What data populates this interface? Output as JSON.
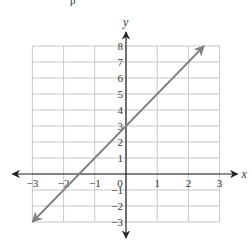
{
  "header_fragment": "p",
  "chart_data": {
    "type": "line",
    "title": "",
    "xlabel": "x",
    "ylabel": "y",
    "xlim": [
      -3,
      3
    ],
    "ylim": [
      -3,
      8
    ],
    "grid": true,
    "x_ticks": [
      -3,
      -2,
      -1,
      0,
      1,
      2,
      3
    ],
    "y_ticks": [
      -3,
      -2,
      -1,
      1,
      2,
      3,
      4,
      5,
      6,
      7,
      8
    ],
    "series": [
      {
        "name": "y = 2x + 3",
        "equation": "y = 2x + 3",
        "slope": 2,
        "intercept": 3,
        "x": [
          -3,
          2.5
        ],
        "y": [
          -3,
          8
        ],
        "arrows_both_ends": true,
        "color": "#808080"
      }
    ],
    "axis_color": "#222222",
    "grid_color": "#c8c8c8"
  }
}
